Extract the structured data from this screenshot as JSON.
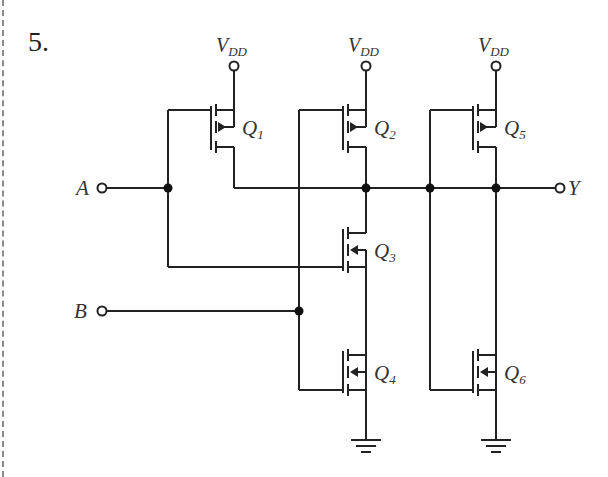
{
  "problem": {
    "number": "5."
  },
  "circuit": {
    "supply_label": "V",
    "supply_subscript": "DD",
    "inputs": [
      {
        "name": "A"
      },
      {
        "name": "B"
      }
    ],
    "output": {
      "name": "Y"
    },
    "transistors": [
      {
        "id": "Q1",
        "letter": "Q",
        "sub": "1",
        "type": "PMOS"
      },
      {
        "id": "Q2",
        "letter": "Q",
        "sub": "2",
        "type": "PMOS"
      },
      {
        "id": "Q3",
        "letter": "Q",
        "sub": "3",
        "type": "NMOS"
      },
      {
        "id": "Q4",
        "letter": "Q",
        "sub": "4",
        "type": "NMOS"
      },
      {
        "id": "Q5",
        "letter": "Q",
        "sub": "5",
        "type": "PMOS"
      },
      {
        "id": "Q6",
        "letter": "Q",
        "sub": "6",
        "type": "NMOS"
      }
    ],
    "colors": {
      "wire": "#222222",
      "label": "#333333",
      "border": "#8a8a8a"
    }
  }
}
